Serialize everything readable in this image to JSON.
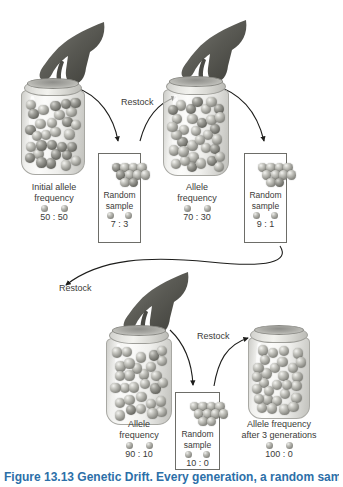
{
  "figure": {
    "caption": "Figure 13.13  Genetic Drift. Every generation, a random sample"
  },
  "steps": [
    {
      "id": "step1",
      "jar_label_line1": "Initial allele",
      "jar_label_line2": "frequency",
      "jar_ratio": "50 : 50",
      "sample_label_line1": "Random",
      "sample_label_line2": "sample",
      "sample_ratio": "7 : 3",
      "jar_marble_count": 60,
      "jar_dark_fraction": 0.5,
      "sample_marbles": 10,
      "sample_dark": 3
    },
    {
      "id": "step2",
      "jar_label_line1": "Allele",
      "jar_label_line2": "frequency",
      "jar_ratio": "70 : 30",
      "sample_label_line1": "Random",
      "sample_label_line2": "sample",
      "sample_ratio": "9 : 1",
      "jar_marble_count": 62,
      "jar_dark_fraction": 0.3,
      "sample_marbles": 10,
      "sample_dark": 1
    },
    {
      "id": "step3",
      "jar_label_line1": "Allele",
      "jar_label_line2": "frequency",
      "jar_ratio": "90 : 10",
      "sample_label_line1": "Random",
      "sample_label_line2": "sample",
      "sample_ratio": "10 : 0",
      "jar_marble_count": 62,
      "jar_dark_fraction": 0.1,
      "sample_marbles": 10,
      "sample_dark": 0
    },
    {
      "id": "step4",
      "jar_label_line1": "Allele frequency",
      "jar_label_line2": "after 3 generations",
      "jar_ratio": "100 : 0",
      "jar_marble_count": 52,
      "jar_dark_fraction": 0.0
    }
  ],
  "restock_labels": [
    {
      "id": "restock-1",
      "text": "Restock"
    },
    {
      "id": "restock-2",
      "text": "Restock"
    },
    {
      "id": "restock-3",
      "text": "Restock"
    }
  ],
  "colors": {
    "allele_light": "#b0b0aa",
    "allele_dark": "#6c6c66",
    "text": "#3a3a38",
    "box_border": "#6d6d68",
    "caption_accent": "#2c6fa8",
    "background": "#ffffff"
  }
}
